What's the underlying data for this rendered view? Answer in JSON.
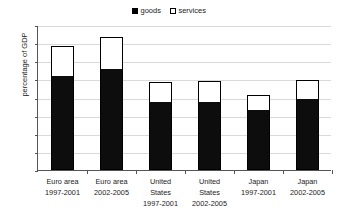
{
  "chart_data": {
    "type": "bar",
    "title": "",
    "xlabel": "",
    "ylabel": "percentage of GDP",
    "ylim": [
      0,
      40
    ],
    "ytick_step": 5,
    "yticks": [
      40,
      35,
      30,
      25,
      20,
      15,
      10,
      5,
      0
    ],
    "grid": true,
    "stacked": true,
    "legend_position": "top-center",
    "colors": {
      "goods": "#000000",
      "services": "#ffffff",
      "outline": "#000000",
      "gridline": "#d9d9d9",
      "axis": "#555555"
    },
    "categories": [
      "Euro area 1997-2001",
      "Euro area 2002-2005",
      "United States 1997-2001",
      "United States 2002-2005",
      "Japan 1997-2001",
      "Japan 2002-2005"
    ],
    "category_lines": [
      [
        "Euro area",
        "1997-2001"
      ],
      [
        "Euro area",
        "2002-2005"
      ],
      [
        "United",
        "States",
        "1997-2001"
      ],
      [
        "United",
        "States",
        "2002-2005"
      ],
      [
        "Japan",
        "1997-2001"
      ],
      [
        "Japan",
        "2002-2005"
      ]
    ],
    "series": [
      {
        "name": "goods",
        "values": [
          25.9,
          27.8,
          18.7,
          18.9,
          16.5,
          19.6
        ]
      },
      {
        "name": "services",
        "values": [
          8.2,
          9.0,
          5.6,
          5.6,
          4.3,
          5.1
        ]
      }
    ],
    "totals": [
      34.1,
      36.8,
      24.3,
      24.5,
      20.8,
      24.7
    ]
  },
  "legend": {
    "entries": [
      {
        "label": "goods",
        "swatch": "filled-black-square"
      },
      {
        "label": "services",
        "swatch": "open-white-square"
      }
    ]
  }
}
